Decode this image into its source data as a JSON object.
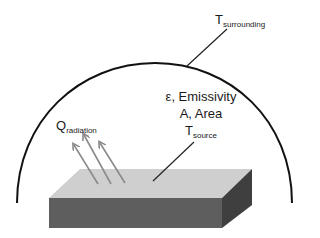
{
  "diagram": {
    "labels": {
      "surrounding": {
        "main": "T",
        "sub": "surrounding"
      },
      "radiation": {
        "main": "Q",
        "sub": "radiation"
      },
      "emissivity": "ε, Emissivity",
      "area": "A, Area",
      "source": {
        "main": "T",
        "sub": "source"
      }
    },
    "colors": {
      "enclosure_stroke": "#111111",
      "slab_top": "#cfcfcf",
      "slab_front": "#5e5e5e",
      "slab_side": "#3f3f3f",
      "arrow": "#8a8a8a",
      "pointer_line": "#222222"
    },
    "elements": {
      "enclosure": "semi-elliptical dome",
      "slab": "3D rectangular slab (source surface)",
      "arrows_count": 3
    }
  }
}
